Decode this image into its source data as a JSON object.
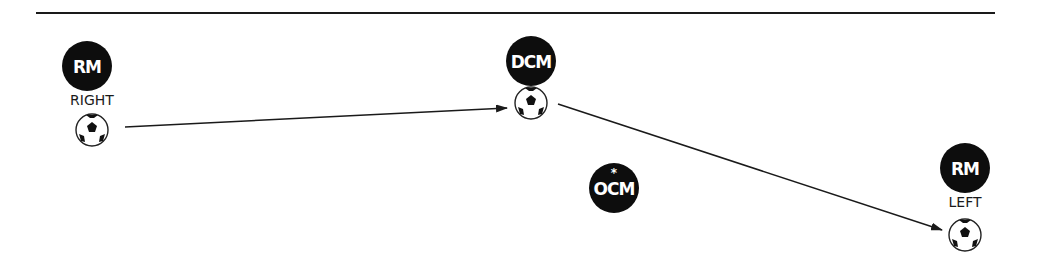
{
  "diagram": {
    "type": "football-drill",
    "top_rule": true,
    "players": [
      {
        "id": "rm-right",
        "role": "RM",
        "side_label": "RIGHT",
        "marker": "",
        "cx": 87,
        "cy": 66,
        "has_ball": true,
        "ball": {
          "cx": 92,
          "cy": 130
        }
      },
      {
        "id": "dcm",
        "role": "DCM",
        "side_label": "",
        "marker": "",
        "cx": 531,
        "cy": 61,
        "has_ball": true,
        "ball": {
          "cx": 531,
          "cy": 103
        }
      },
      {
        "id": "ocm",
        "role": "OCM",
        "side_label": "",
        "marker": "*",
        "cx": 614,
        "cy": 188,
        "has_ball": false
      },
      {
        "id": "rm-left",
        "role": "RM",
        "side_label": "LEFT",
        "marker": "",
        "cx": 965,
        "cy": 168,
        "has_ball": true,
        "ball": {
          "cx": 965,
          "cy": 235
        }
      }
    ],
    "passes": [
      {
        "from": "rm-right",
        "to": "dcm",
        "x1": 125,
        "y1": 127,
        "x2": 507,
        "y2": 108
      },
      {
        "from": "dcm",
        "to": "rm-left",
        "x1": 558,
        "y1": 104,
        "x2": 942,
        "y2": 230
      }
    ],
    "colors": {
      "player_fill": "#0d0d0d",
      "player_text": "#ffffff",
      "line": "#1a1a1a",
      "background": "#ffffff"
    }
  }
}
